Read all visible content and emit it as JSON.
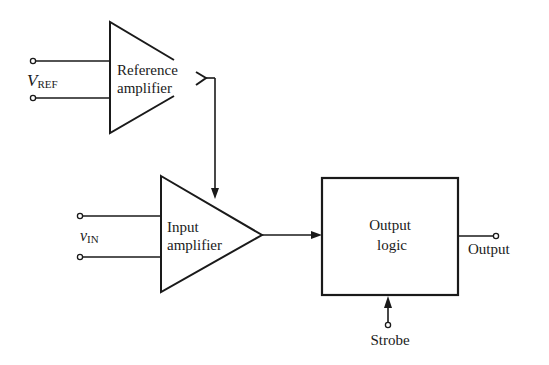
{
  "diagram": {
    "title": "",
    "blocks": {
      "reference_amplifier": {
        "line1": "Reference",
        "line2": "amplifier",
        "shape": "triangle"
      },
      "input_amplifier": {
        "line1": "Input",
        "line2": "amplifier",
        "shape": "triangle"
      },
      "output_logic": {
        "line1": "Output",
        "line2": "logic",
        "shape": "rectangle"
      }
    },
    "inputs": {
      "vref": {
        "main": "V",
        "subscript": "REF"
      },
      "vin": {
        "main": "v",
        "subscript": "IN"
      }
    },
    "outputs": {
      "output_label": "Output",
      "strobe_label": "Strobe"
    },
    "connections": [
      {
        "from": "V_REF terminals",
        "to": "Reference amplifier"
      },
      {
        "from": "Reference amplifier",
        "to": "Input amplifier"
      },
      {
        "from": "v_IN terminals",
        "to": "Input amplifier"
      },
      {
        "from": "Input amplifier",
        "to": "Output logic"
      },
      {
        "from": "Output logic",
        "to": "Output"
      },
      {
        "from": "Strobe",
        "to": "Output logic"
      }
    ],
    "colors": {
      "ink": "#1a1a1a",
      "background": "#ffffff"
    }
  }
}
